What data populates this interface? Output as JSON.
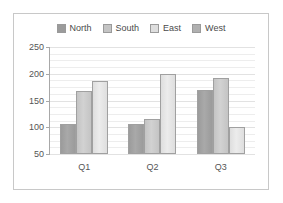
{
  "chart_data": {
    "type": "bar",
    "title": "",
    "xlabel": "",
    "ylabel": "",
    "categories": [
      "Q1",
      "Q2",
      "Q3"
    ],
    "ylim": [
      50,
      250
    ],
    "yticks": [
      50,
      100,
      150,
      200,
      250
    ],
    "ytick_labels": [
      "50",
      "100",
      "150",
      "200",
      "250"
    ],
    "grid": true,
    "legend_position": "top-center",
    "series": [
      {
        "name": "North",
        "color": "#9b9b9b",
        "values": [
          107,
          107,
          170
        ]
      },
      {
        "name": "South",
        "color": "#c4c4c4",
        "values": [
          167,
          116,
          193
        ]
      },
      {
        "name": "East",
        "color": "#dedede",
        "values": [
          186,
          199,
          101
        ]
      },
      {
        "name": "West",
        "color": "#b0b0b0",
        "values": [
          null,
          null,
          null
        ]
      }
    ]
  },
  "legend": {
    "entries": [
      {
        "label": "North",
        "color": "#9b9b9b"
      },
      {
        "label": "South",
        "color": "#c4c4c4"
      },
      {
        "label": "East",
        "color": "#dedede"
      },
      {
        "label": "West",
        "color": "#b0b0b0"
      }
    ]
  },
  "axes": {
    "y_labels": [
      "250",
      "200",
      "150",
      "100",
      "50"
    ],
    "x_labels": [
      "Q1",
      "Q2",
      "Q3"
    ]
  }
}
